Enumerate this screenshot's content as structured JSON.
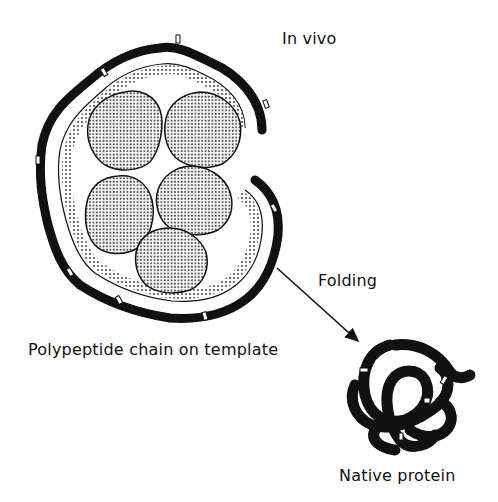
{
  "figure": {
    "labels": {
      "in_vivo": "In vivo",
      "folding": "Folding",
      "template": "Polypeptide chain on template",
      "native": "Native protein"
    },
    "elements": {
      "template_particles": 5,
      "arrow": "folding-arrow",
      "chain_state_left": "extended polypeptide chain wrapped around template",
      "chain_state_right": "folded native protein"
    },
    "colors": {
      "ink": "#111111",
      "background": "#ffffff",
      "stipple": "#888888"
    }
  }
}
